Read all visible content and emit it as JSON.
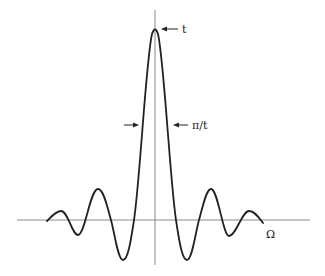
{
  "diagram": {
    "title": "",
    "type": "sinc-function-plot",
    "labels": {
      "peak": "t",
      "width": "π/t",
      "x_axis": "Ω"
    },
    "colors": {
      "curve": "#222222",
      "axis": "#888888",
      "background": "#ffffff"
    },
    "annotations": [
      {
        "name": "peak-height",
        "text": "t",
        "points_to": "peak of curve"
      },
      {
        "name": "main-lobe-width",
        "text": "π/t",
        "points_to": "main lobe width between arrows"
      }
    ]
  }
}
